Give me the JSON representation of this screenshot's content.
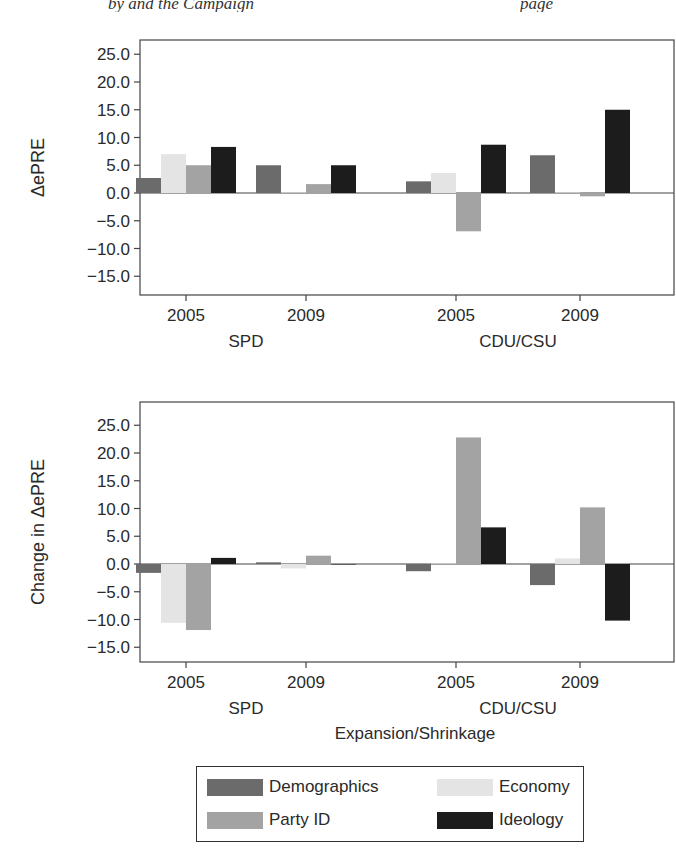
{
  "running_head": {
    "left": "by  and  the  Campaign",
    "right": "page"
  },
  "colors": {
    "Demographics": "#6b6b6b",
    "Economy": "#e4e4e4",
    "Party ID": "#a3a3a3",
    "Ideology": "#1c1c1c"
  },
  "legend": {
    "items": [
      {
        "label": "Demographics",
        "key": "Demographics"
      },
      {
        "label": "Economy",
        "key": "Economy"
      },
      {
        "label": "Party ID",
        "key": "Party ID"
      },
      {
        "label": "Ideology",
        "key": "Ideology"
      }
    ]
  },
  "chart_data": [
    {
      "type": "bar",
      "title": "Initial Gap",
      "xlabel": "Initial Gap",
      "ylabel": "ΔePRE",
      "ylim": [
        -18,
        27
      ],
      "yticks": [
        "25.0",
        "20.0",
        "15.0",
        "10.0",
        "5.0",
        "0.0",
        "-5.0",
        "-10.0",
        "-15.0"
      ],
      "grid": false,
      "legend_position": "bottom",
      "groups": [
        {
          "party": "SPD",
          "years": [
            "2005",
            "2009"
          ]
        },
        {
          "party": "CDU/CSU",
          "years": [
            "2005",
            "2009"
          ]
        }
      ],
      "categories": [
        "SPD 2005",
        "SPD 2009",
        "CDU/CSU 2005",
        "CDU/CSU 2009"
      ],
      "series": [
        {
          "name": "Demographics",
          "values": [
            2.7,
            5.0,
            2.1,
            6.8
          ]
        },
        {
          "name": "Economy",
          "values": [
            7.0,
            0.1,
            3.6,
            0.1
          ]
        },
        {
          "name": "Party ID",
          "values": [
            5.0,
            1.6,
            -6.9,
            -0.6
          ]
        },
        {
          "name": "Ideology",
          "values": [
            8.3,
            5.0,
            8.7,
            15.0
          ]
        }
      ]
    },
    {
      "type": "bar",
      "title": "Expansion/Shrinkage",
      "xlabel": "Expansion/Shrinkage",
      "ylabel": "Change in ΔePRE",
      "ylim": [
        -18,
        27
      ],
      "yticks": [
        "25.0",
        "20.0",
        "15.0",
        "10.0",
        "5.0",
        "0.0",
        "-5.0",
        "-10.0",
        "-15.0"
      ],
      "grid": false,
      "legend_position": "bottom",
      "groups": [
        {
          "party": "SPD",
          "years": [
            "2005",
            "2009"
          ]
        },
        {
          "party": "CDU/CSU",
          "years": [
            "2005",
            "2009"
          ]
        }
      ],
      "categories": [
        "SPD 2005",
        "SPD 2009",
        "CDU/CSU 2005",
        "CDU/CSU 2009"
      ],
      "series": [
        {
          "name": "Demographics",
          "values": [
            -1.6,
            0.3,
            -1.3,
            -3.8
          ]
        },
        {
          "name": "Economy",
          "values": [
            -10.6,
            -0.8,
            0.1,
            1.0
          ]
        },
        {
          "name": "Party ID",
          "values": [
            -11.9,
            1.5,
            22.8,
            10.2
          ]
        },
        {
          "name": "Ideology",
          "values": [
            1.1,
            0.0,
            6.6,
            -10.2
          ]
        }
      ]
    }
  ]
}
